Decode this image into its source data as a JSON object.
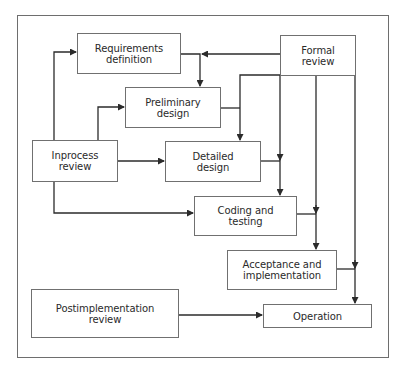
{
  "diagram": {
    "type": "flowchart",
    "colors": {
      "line": "#2b2b2b",
      "box_border": "#707070",
      "text": "#2a2a2a",
      "background": "#ffffff"
    },
    "nodes": [
      {
        "id": "requirements",
        "label": "Requirements definition",
        "line1": "Requirements",
        "line2": "definition"
      },
      {
        "id": "formal",
        "label": "Formal review",
        "line1": "Formal",
        "line2": "review"
      },
      {
        "id": "preliminary",
        "label": "Preliminary design",
        "line1": "Preliminary",
        "line2": "design"
      },
      {
        "id": "inprocess",
        "label": "Inprocess review",
        "line1": "Inprocess",
        "line2": "review"
      },
      {
        "id": "detailed",
        "label": "Detailed design",
        "line1": "Detailed",
        "line2": "design"
      },
      {
        "id": "coding",
        "label": "Coding and testing",
        "line1": "Coding and",
        "line2": "testing"
      },
      {
        "id": "acceptance",
        "label": "Acceptance and implementation",
        "line1": "Acceptance and",
        "line2": "implementation"
      },
      {
        "id": "postimpl",
        "label": "Postimplementation review",
        "line1": "Postimplementation",
        "line2": "review"
      },
      {
        "id": "operation",
        "label": "Operation",
        "line1": "Operation",
        "line2": ""
      }
    ],
    "edges": [
      {
        "from": "inprocess",
        "to": "requirements"
      },
      {
        "from": "inprocess",
        "to": "preliminary"
      },
      {
        "from": "inprocess",
        "to": "detailed"
      },
      {
        "from": "inprocess",
        "to": "coding"
      },
      {
        "from": "formal",
        "to": "requirements"
      },
      {
        "from": "formal",
        "to": "detailed"
      },
      {
        "from": "formal",
        "to": "coding"
      },
      {
        "from": "formal",
        "to": "acceptance"
      },
      {
        "from": "formal",
        "to": "operation"
      },
      {
        "from": "requirements",
        "to": "preliminary"
      },
      {
        "from": "preliminary",
        "to": "detailed"
      },
      {
        "from": "detailed",
        "to": "coding"
      },
      {
        "from": "coding",
        "to": "acceptance"
      },
      {
        "from": "acceptance",
        "to": "operation"
      },
      {
        "from": "postimpl",
        "to": "operation"
      }
    ]
  }
}
